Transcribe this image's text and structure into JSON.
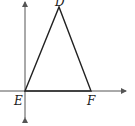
{
  "diagram": {
    "type": "coordinate-geometry",
    "points": {
      "D": {
        "label": "D",
        "x": 59,
        "y": 7
      },
      "E": {
        "label": "E",
        "x": 25,
        "y": 91
      },
      "F": {
        "label": "F",
        "x": 91,
        "y": 91
      }
    },
    "axes": {
      "x_axis": {
        "y": 91,
        "from": 0,
        "to": 126,
        "arrow": "right"
      },
      "y_axis": {
        "x": 25,
        "from": 0,
        "to": 120,
        "arrow": "both"
      }
    },
    "colors": {
      "stroke": "#222222",
      "axis": "#555555",
      "background": "#ffffff"
    }
  }
}
